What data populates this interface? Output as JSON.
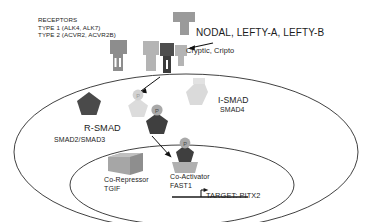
{
  "diagram": {
    "labels": {
      "receptors_title": "RECEPTORS",
      "receptors_type1": "TYPE 1 (ALK4, ALK7)",
      "receptors_type2": "TYPE 2 (ACVR2, ACVR2B)",
      "ligands": "NODAL, LEFTY-A, LEFTY-B",
      "coreceptor": "Cryptic, Cripto",
      "ismad": "I-SMAD",
      "ismad_sub": "SMAD4",
      "rsmad": "R-SMAD",
      "rsmad_sub": "SMAD2/SMAD3",
      "corepressor": "Co-Repressor",
      "corepressor_sub": "TGIF",
      "coactivator": "Co-Activator",
      "coactivator_sub": "FAST1",
      "target": "TARGET: PITX2",
      "phospho_mark": "P"
    },
    "colors": {
      "stroke": "#2b2b2b",
      "receptor_type2": "#8d8d8d",
      "receptor_type1_light": "#b4b4b4",
      "receptor_type1_dark": "#4e4e4e",
      "ligand": "#9a9a9a",
      "rsmad_dark": "#4a4a4a",
      "rsmad_faded": "#d5d5d5",
      "ismad": "#d9d9d9",
      "phospho_circle": "#a9a9a9",
      "corepressor_box": "#a6a6a6",
      "coactivator_block": "#b0b0b0",
      "background": "#ffffff"
    }
  }
}
